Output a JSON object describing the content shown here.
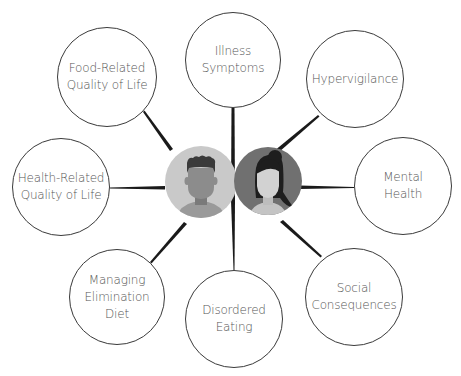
{
  "diagram": {
    "type": "hub-and-spoke",
    "center": {
      "description": "Two person avatars (male and female) side by side",
      "avatars": [
        {
          "id": "male",
          "icon": "male-avatar-icon",
          "bg": "#c9c9c9",
          "face": "#8c8c8c",
          "hair": "#3a3a3a",
          "shirt": "#9a9a9a"
        },
        {
          "id": "female",
          "icon": "female-avatar-icon",
          "bg": "#707070",
          "face": "#d2d2d2",
          "hair": "#1e1e1e",
          "shirt": "#c4c4c4"
        }
      ]
    },
    "nodes": [
      {
        "id": "food-qol",
        "label": "Food-Related\nQuality of Life",
        "cx": 107,
        "cy": 77,
        "r": 50
      },
      {
        "id": "illness",
        "label": "Illness\nSymptoms",
        "cx": 233,
        "cy": 60,
        "r": 48
      },
      {
        "id": "hypervigilance",
        "label": "Hypervigilance",
        "cx": 355,
        "cy": 79,
        "r": 49
      },
      {
        "id": "mental-health",
        "label": "Mental\nHealth",
        "cx": 403,
        "cy": 186,
        "r": 49
      },
      {
        "id": "social",
        "label": "Social\nConsequences",
        "cx": 354,
        "cy": 297,
        "r": 49
      },
      {
        "id": "disordered-eating",
        "label": "Disordered\nEating",
        "cx": 234,
        "cy": 319,
        "r": 49
      },
      {
        "id": "managing-diet",
        "label": "Managing\nElimination\nDiet",
        "cx": 117,
        "cy": 297,
        "r": 48
      },
      {
        "id": "health-qol",
        "label": "Health-Related\nQuality of Life",
        "cx": 61,
        "cy": 187,
        "r": 49
      }
    ],
    "spoke_color": "#1a1a1a",
    "node_border_color": "#3a3a3a",
    "label_color": "#555555"
  },
  "labels": {
    "food_qol": "Food-Related\nQuality of Life",
    "illness": "Illness\nSymptoms",
    "hypervigilance": "Hypervigilance",
    "mental_health": "Mental\nHealth",
    "social": "Social\nConsequences",
    "disordered_eating": "Disordered\nEating",
    "managing_diet": "Managing\nElimination\nDiet",
    "health_qol": "Health-Related\nQuality of Life"
  }
}
